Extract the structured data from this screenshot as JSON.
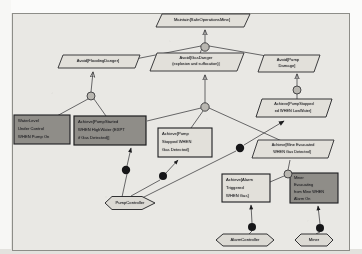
{
  "diagram": {
    "type": "goal-refinement-diagram",
    "colors": {
      "paper": "#efeeea",
      "canvas": "#e9e8e4",
      "stroke": "#2a2a2c",
      "goal_fill": "#dedcd6",
      "expectation_fill": "#8f8d88",
      "requirement_fill": "#8f8d88",
      "light_fill": "#e2e0da",
      "agent_fill": "#dcdad4",
      "refinement_fill": "#b9b7b1",
      "responsibility_fill": "#161618"
    }
  },
  "goals": [
    {
      "id": "g-root",
      "name": "maintain-safe-operations-mine",
      "shape": "parallelogram",
      "fill": "light",
      "lines": [
        "Maintain[SafeOperationsMine]"
      ],
      "x": 156,
      "y": 14,
      "w": 94,
      "h": 13
    },
    {
      "id": "g-flood",
      "name": "avoid-flooding-danger",
      "shape": "parallelogram",
      "fill": "light",
      "lines": [
        "Avoid[FloodingDanger]"
      ],
      "x": 58,
      "y": 55,
      "w": 82,
      "h": 13
    },
    {
      "id": "g-gas",
      "name": "avoid-gas-danger",
      "shape": "parallelogram",
      "fill": "light",
      "lines": [
        "Avoid[GasDanger",
        "(explosion and suffocation)]"
      ],
      "x": 150,
      "y": 53,
      "w": 94,
      "h": 18
    },
    {
      "id": "g-pump",
      "name": "avoid-pump-damage",
      "shape": "parallelogram",
      "fill": "light",
      "lines": [
        "Avoid[Pump",
        "Damage]"
      ],
      "x": 258,
      "y": 55,
      "w": 62,
      "h": 17
    },
    {
      "id": "g-stop-low",
      "name": "achieve-pump-stopped-when-low-water",
      "shape": "parallelogram",
      "fill": "light",
      "lines": [
        "Achieve[PumpStopped",
        "ed WHEN LowWater]"
      ],
      "x": 256,
      "y": 99,
      "w": 76,
      "h": 18
    },
    {
      "id": "g-evac",
      "name": "achieve-mine-evacuated-when-gas-detected",
      "shape": "parallelogram",
      "fill": "light",
      "lines": [
        "Achieve[Mine Evacuated",
        "WHEN Gas Detected]"
      ],
      "x": 252,
      "y": 140,
      "w": 82,
      "h": 18
    }
  ],
  "requirements": [
    {
      "id": "r-water",
      "name": "water-level-under-control-when-pump-on",
      "shape": "rect",
      "fill": "dark",
      "align": "left",
      "lines": [
        "WaterLevel",
        "Under Control",
        "WHEN Pump On"
      ],
      "x": 14,
      "y": 115,
      "w": 56,
      "h": 29
    },
    {
      "id": "r-start",
      "name": "achieve-pump-started-when-high-water",
      "shape": "rect",
      "fill": "dark",
      "align": "left",
      "lines": [
        "Achieve[PumpStarted",
        "WHEN HighWater (EXPT",
        "if Gas Detected)]"
      ],
      "x": 74,
      "y": 116,
      "w": 72,
      "h": 29
    },
    {
      "id": "r-stop-gas",
      "name": "achieve-pump-stopped-when-gas-detected",
      "shape": "rect",
      "fill": "light",
      "align": "left",
      "lines": [
        "Achieve[Pump",
        "Stopped WHEN",
        "Gas Detected]"
      ],
      "x": 158,
      "y": 128,
      "w": 54,
      "h": 29
    },
    {
      "id": "r-alarm",
      "name": "achieve-alarm-triggered-when-gas",
      "shape": "rect",
      "fill": "light",
      "align": "left",
      "lines": [
        "Achieve[Alarm",
        "Triggered",
        "WHEN Gas]"
      ],
      "x": 222,
      "y": 174,
      "w": 48,
      "h": 28
    },
    {
      "id": "e-miner",
      "name": "miner-evacuating-mine-when-alarm-on",
      "shape": "rect",
      "fill": "dark",
      "align": "left",
      "lines": [
        "Miner",
        "Evacuating",
        "from Mine WHEN",
        "Alarm On"
      ],
      "x": 290,
      "y": 173,
      "w": 48,
      "h": 30
    }
  ],
  "agents": [
    {
      "id": "a-pump",
      "name": "agent-pump-controller",
      "label": "PumpController",
      "cx": 127,
      "cy": 203,
      "w": 56,
      "h": 13
    },
    {
      "id": "a-alarm",
      "name": "agent-alarm-controller",
      "label": "AlarmController",
      "cx": 245,
      "cy": 240,
      "w": 58,
      "h": 12
    },
    {
      "id": "a-miner",
      "name": "agent-miner",
      "label": "Miner",
      "cx": 314,
      "cy": 240,
      "w": 38,
      "h": 12
    }
  ],
  "refinements": [
    {
      "id": "ref-root",
      "name": "refinement-node-root",
      "cx": 205,
      "cy": 47,
      "r": 4.2
    },
    {
      "id": "ref-flood",
      "name": "refinement-node-flooding",
      "cx": 91,
      "cy": 96,
      "r": 4.0
    },
    {
      "id": "ref-gas",
      "name": "refinement-node-gas",
      "cx": 205,
      "cy": 107,
      "r": 4.2
    },
    {
      "id": "ref-pump",
      "name": "refinement-node-pump",
      "cx": 297,
      "cy": 90,
      "r": 4.0
    },
    {
      "id": "ref-evac",
      "name": "refinement-node-evac",
      "cx": 288,
      "cy": 174,
      "r": 4.0
    }
  ],
  "responsibilities": [
    {
      "id": "resp-1",
      "name": "responsibility-link-pump-started",
      "cx": 126,
      "cy": 170,
      "r": 4.2
    },
    {
      "id": "resp-2",
      "name": "responsibility-link-pump-stopped-gas",
      "cx": 163,
      "cy": 176,
      "r": 4.0
    },
    {
      "id": "resp-3",
      "name": "responsibility-link-pump-stopped-low",
      "cx": 240,
      "cy": 148,
      "r": 4.2
    },
    {
      "id": "resp-4",
      "name": "responsibility-link-alarm-triggered",
      "cx": 252,
      "cy": 227,
      "r": 4.0
    },
    {
      "id": "resp-5",
      "name": "responsibility-link-miner-evacuating",
      "cx": 320,
      "cy": 228,
      "r": 4.0
    }
  ]
}
